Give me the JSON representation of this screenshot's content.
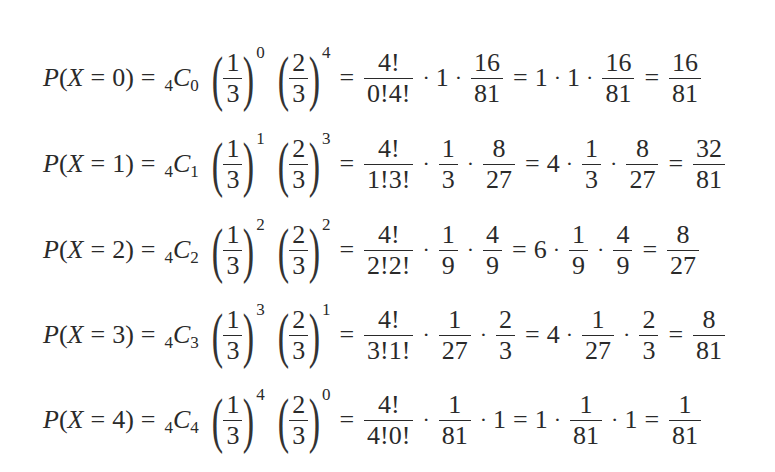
{
  "equations": [
    {
      "lhs": {
        "P": "P",
        "open": "(",
        "X": "X",
        "eq": "=",
        "k": "0",
        "close": ")"
      },
      "binom": {
        "n": "4",
        "C": "C",
        "k": "0"
      },
      "term1": {
        "num": "1",
        "den": "3",
        "exp": "0"
      },
      "term2": {
        "num": "2",
        "den": "3",
        "exp": "4"
      },
      "step1": {
        "coef": {
          "num": "4!",
          "den": "0!4!"
        },
        "f1": {
          "type": "int",
          "val": "1"
        },
        "f2": {
          "type": "frac",
          "num": "16",
          "den": "81"
        }
      },
      "step2": {
        "coef": "1",
        "f1": {
          "type": "int",
          "val": "1"
        },
        "f2": {
          "type": "frac",
          "num": "16",
          "den": "81"
        }
      },
      "result": {
        "num": "16",
        "den": "81"
      }
    },
    {
      "lhs": {
        "P": "P",
        "open": "(",
        "X": "X",
        "eq": "=",
        "k": "1",
        "close": ")"
      },
      "binom": {
        "n": "4",
        "C": "C",
        "k": "1"
      },
      "term1": {
        "num": "1",
        "den": "3",
        "exp": "1"
      },
      "term2": {
        "num": "2",
        "den": "3",
        "exp": "3"
      },
      "step1": {
        "coef": {
          "num": "4!",
          "den": "1!3!"
        },
        "f1": {
          "type": "frac",
          "num": "1",
          "den": "3"
        },
        "f2": {
          "type": "frac",
          "num": "8",
          "den": "27"
        }
      },
      "step2": {
        "coef": "4",
        "f1": {
          "type": "frac",
          "num": "1",
          "den": "3"
        },
        "f2": {
          "type": "frac",
          "num": "8",
          "den": "27"
        }
      },
      "result": {
        "num": "32",
        "den": "81"
      }
    },
    {
      "lhs": {
        "P": "P",
        "open": "(",
        "X": "X",
        "eq": "=",
        "k": "2",
        "close": ")"
      },
      "binom": {
        "n": "4",
        "C": "C",
        "k": "2"
      },
      "term1": {
        "num": "1",
        "den": "3",
        "exp": "2"
      },
      "term2": {
        "num": "2",
        "den": "3",
        "exp": "2"
      },
      "step1": {
        "coef": {
          "num": "4!",
          "den": "2!2!"
        },
        "f1": {
          "type": "frac",
          "num": "1",
          "den": "9"
        },
        "f2": {
          "type": "frac",
          "num": "4",
          "den": "9"
        }
      },
      "step2": {
        "coef": "6",
        "f1": {
          "type": "frac",
          "num": "1",
          "den": "9"
        },
        "f2": {
          "type": "frac",
          "num": "4",
          "den": "9"
        }
      },
      "result": {
        "num": "8",
        "den": "27"
      }
    },
    {
      "lhs": {
        "P": "P",
        "open": "(",
        "X": "X",
        "eq": "=",
        "k": "3",
        "close": ")"
      },
      "binom": {
        "n": "4",
        "C": "C",
        "k": "3"
      },
      "term1": {
        "num": "1",
        "den": "3",
        "exp": "3"
      },
      "term2": {
        "num": "2",
        "den": "3",
        "exp": "1"
      },
      "step1": {
        "coef": {
          "num": "4!",
          "den": "3!1!"
        },
        "f1": {
          "type": "frac",
          "num": "1",
          "den": "27"
        },
        "f2": {
          "type": "frac",
          "num": "2",
          "den": "3"
        }
      },
      "step2": {
        "coef": "4",
        "f1": {
          "type": "frac",
          "num": "1",
          "den": "27"
        },
        "f2": {
          "type": "frac",
          "num": "2",
          "den": "3"
        }
      },
      "result": {
        "num": "8",
        "den": "81"
      }
    },
    {
      "lhs": {
        "P": "P",
        "open": "(",
        "X": "X",
        "eq": "=",
        "k": "4",
        "close": ")"
      },
      "binom": {
        "n": "4",
        "C": "C",
        "k": "4"
      },
      "term1": {
        "num": "1",
        "den": "3",
        "exp": "4"
      },
      "term2": {
        "num": "2",
        "den": "3",
        "exp": "0"
      },
      "step1": {
        "coef": {
          "num": "4!",
          "den": "4!0!"
        },
        "f1": {
          "type": "frac",
          "num": "1",
          "den": "81"
        },
        "f2": {
          "type": "int",
          "val": "1"
        }
      },
      "step2": {
        "coef": "1",
        "f1": {
          "type": "frac",
          "num": "1",
          "den": "81"
        },
        "f2": {
          "type": "int",
          "val": "1"
        }
      },
      "result": {
        "num": "1",
        "den": "81"
      }
    }
  ],
  "symbols": {
    "equals": "=",
    "cdot": "·",
    "lparen": "(",
    "rparen": ")"
  }
}
